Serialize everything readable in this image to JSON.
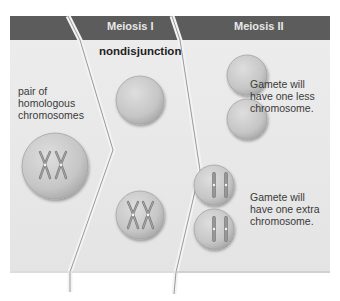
{
  "header": {
    "phase_1_label": "Meiosis I",
    "phase_2_label": "Meiosis II"
  },
  "title": "nondisjunction",
  "parent_cell": {
    "label_line_1": "pair of",
    "label_line_2": "homologous",
    "label_line_3": "chromosomes"
  },
  "gametes": {
    "less": {
      "line_1": "Gamete will",
      "line_2": "have one less",
      "line_3": "chromosome."
    },
    "extra": {
      "line_1": "Gamete will",
      "line_2": "have one extra",
      "line_3": "chromosome."
    }
  },
  "colors": {
    "header_band": "#5c5c5c",
    "panel_bg": "#e9e9e9",
    "cell_fill": "#c9c9c9",
    "cell_edge": "#a8a8a8",
    "chromosome": "#8a8a8a",
    "divider": "#9a9a9a"
  }
}
